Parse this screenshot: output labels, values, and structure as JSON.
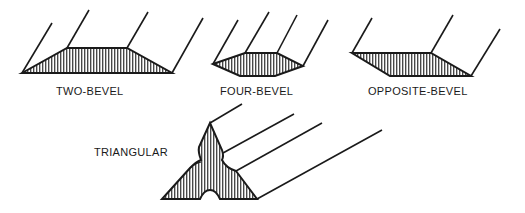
{
  "colors": {
    "ink": "#1a1a1a",
    "background": "#ffffff"
  },
  "shapes": [
    {
      "id": "two-bevel",
      "label": "TWO-BEVEL"
    },
    {
      "id": "four-bevel",
      "label": "FOUR-BEVEL"
    },
    {
      "id": "opposite-bevel",
      "label": "OPPOSITE-BEVEL"
    },
    {
      "id": "triangular",
      "label": "TRIANGULAR"
    }
  ]
}
